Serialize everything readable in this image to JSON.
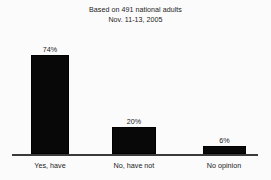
{
  "chart_data": {
    "type": "bar",
    "title": "Based on 491 national adults\nNov. 11-13, 2005",
    "title_lines": [
      "Based on 491 national adults",
      "Nov. 11-13, 2005"
    ],
    "categories": [
      "Yes, have",
      "No, have not",
      "No opinion"
    ],
    "values": [
      74,
      20,
      6
    ],
    "value_labels": [
      "74%",
      "20%",
      "6%"
    ],
    "xlabel": "",
    "ylabel": "",
    "ylim": [
      0,
      80
    ],
    "grid": false,
    "legend": false,
    "bar_color": "#080808",
    "axis_color": "#3a3a3a",
    "text_color": "#1c1c1c",
    "background": "#fbfbfb"
  }
}
